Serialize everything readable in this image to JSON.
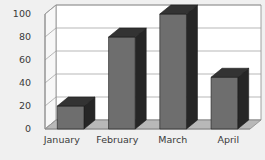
{
  "chart_data": {
    "type": "bar",
    "title": "",
    "subtitle": "",
    "xlabel": "",
    "ylabel": "",
    "categories": [
      "January",
      "February",
      "March",
      "April"
    ],
    "values": [
      20,
      80,
      100,
      45
    ],
    "series": [
      {
        "name": "Series 1",
        "values": [
          20,
          80,
          100,
          45
        ]
      }
    ],
    "ylim": [
      0,
      100
    ],
    "yticks": [
      0,
      20,
      40,
      60,
      80,
      100
    ],
    "ytick_labels": [
      "0",
      "20",
      "40",
      "60",
      "80",
      "100"
    ],
    "grid": true,
    "grid_axis": "y",
    "legend": false,
    "legend_position": "none",
    "style": "3d",
    "annotations": []
  },
  "colors": {
    "background": "#f0f0f0",
    "plot_background": "#ffffff",
    "wall_side": "#f7f7f7",
    "floor": "#b8b8b8",
    "gridline": "#9a9a9a",
    "axis": "#8a8a8a",
    "bar_front": "#6e6e6e",
    "bar_side": "#262626",
    "bar_top": "#333333",
    "text": "#3a3a3a"
  },
  "axes": {
    "y_ticks": [
      {
        "label": "100",
        "value": 100
      },
      {
        "label": "80",
        "value": 80
      },
      {
        "label": "60",
        "value": 60
      },
      {
        "label": "40",
        "value": 40
      },
      {
        "label": "20",
        "value": 20
      },
      {
        "label": "0",
        "value": 0
      }
    ],
    "x_categories": [
      {
        "label": "January"
      },
      {
        "label": "February"
      },
      {
        "label": "March"
      },
      {
        "label": "April"
      }
    ]
  }
}
